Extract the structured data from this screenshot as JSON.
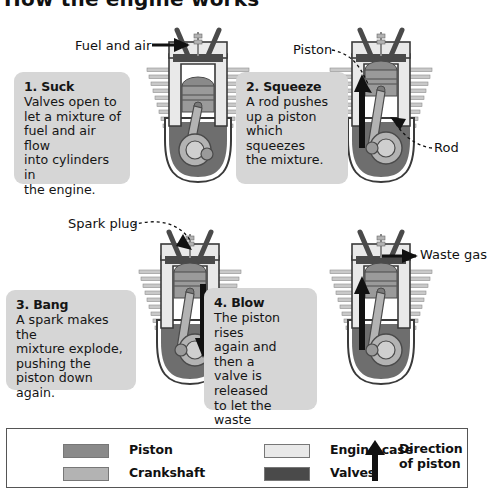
{
  "title": "How the engine works",
  "background": "#ffffff",
  "steps": [
    {
      "id": "suck",
      "heading": "1. Suck",
      "body": "Valves open to\nlet a mixture of\nfuel and air flow\ninto cylinders in\nthe engine."
    },
    {
      "id": "squeeze",
      "heading": "2. Squeeze",
      "body": "A rod pushes\nup a piston\nwhich squeezes\nthe mixture."
    },
    {
      "id": "bang",
      "heading": "3. Bang",
      "body": "A spark makes the\nmixture explode,\npushing the\npiston down\nagain."
    },
    {
      "id": "blow",
      "heading": "4. Blow",
      "body": "The piston rises\nagain and then a\nvalve is released\nto let the waste\ngas out. The\ncycle starts all\nover again."
    }
  ],
  "callouts": {
    "fuel_and_air": "Fuel and air",
    "piston": "Piston",
    "rod": "Rod",
    "spark_plug": "Spark plug",
    "waste_gas": "Waste gas"
  },
  "legend": {
    "items": [
      {
        "label": "Piston",
        "color": "#8a8a8a"
      },
      {
        "label": "Crankshaft",
        "color": "#b3b3b3"
      },
      {
        "label": "Engine case",
        "color": "#e9e9e9"
      },
      {
        "label": "Valves",
        "color": "#4a4a4a"
      }
    ],
    "direction_label": "Direction\nof piston",
    "direction_arrow": "up-arrow-icon"
  },
  "diagrams": [
    {
      "id": "engine-1",
      "step": "1. Suck",
      "piston_position": "low",
      "arrow_direction": "down",
      "arrow_shown": false
    },
    {
      "id": "engine-2",
      "step": "2. Squeeze",
      "piston_position": "high",
      "arrow_direction": "up",
      "arrow_shown": true
    },
    {
      "id": "engine-3",
      "step": "3. Bang",
      "piston_position": "high",
      "arrow_direction": "down",
      "arrow_shown": true
    },
    {
      "id": "engine-4",
      "step": "4. Blow",
      "piston_position": "high",
      "arrow_direction": "up",
      "arrow_shown": true
    }
  ],
  "colors": {
    "piston": "#8a8a8a",
    "crankshaft": "#b3b3b3",
    "engine_case": "#e9e9e9",
    "valves": "#4a4a4a",
    "block": "#6e6e6e",
    "fins": "#c9c9c9",
    "box_bg": "#d6d6d6",
    "text": "#111111",
    "outline": "#555555"
  }
}
